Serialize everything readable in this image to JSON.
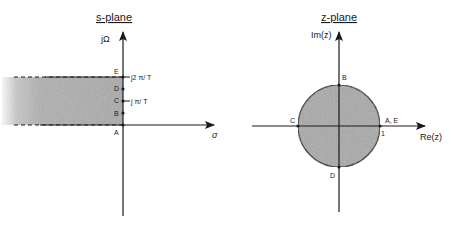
{
  "s_plane": {
    "title": "s-plane",
    "vertical_axis_label": "jΩ",
    "horizontal_axis_label": "σ",
    "points": [
      {
        "label": "A",
        "position": "origin"
      },
      {
        "label": "B",
        "position": "between 0 and jπ/T"
      },
      {
        "label": "C",
        "position": "jπ/T"
      },
      {
        "label": "D",
        "position": "between jπ/T and j2π/T"
      },
      {
        "label": "E",
        "position": "j2π/T"
      }
    ],
    "tick_labels": {
      "pi_over_T": "j π/ T",
      "two_pi_over_T": "j2 π/ T"
    },
    "shaded_region": "strip 0 ≤ Ω ≤ 2π/T, σ < 0 (left half-plane)"
  },
  "z_plane": {
    "title": "z-plane",
    "vertical_axis_label": "Im(z)",
    "horizontal_axis_label": "Re(z)",
    "unit_circle_label": "1",
    "points": [
      {
        "label": "A, E",
        "position": "z = 1"
      },
      {
        "label": "B",
        "position": "z = j"
      },
      {
        "label": "C",
        "position": "z = -1"
      },
      {
        "label": "D",
        "position": "z = -j"
      }
    ],
    "shaded_region": "interior of unit circle"
  },
  "colors": {
    "ink": "#1a1a1a",
    "shade": "#a8a8a8",
    "background": "#ffffff"
  }
}
